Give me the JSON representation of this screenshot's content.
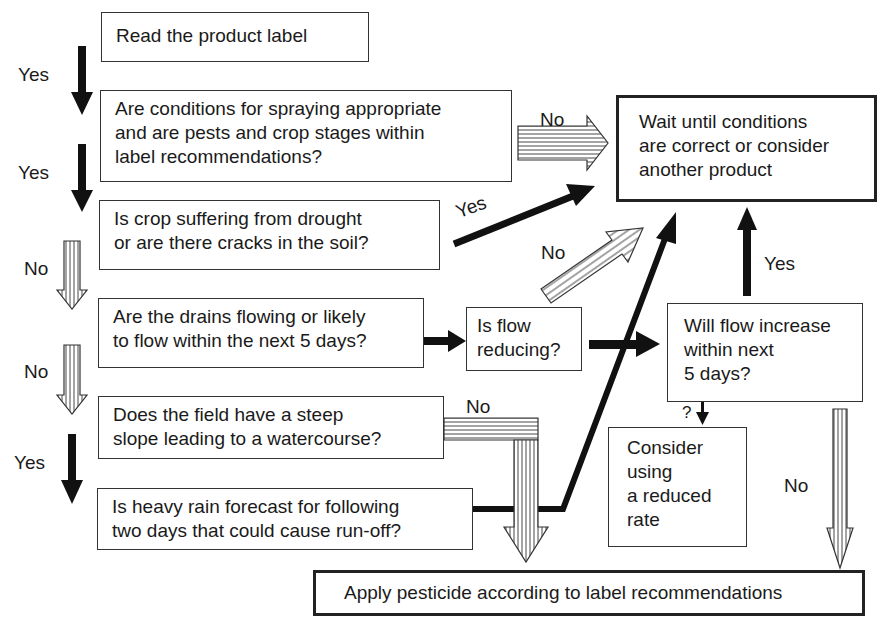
{
  "diagram": {
    "boxes": {
      "read_label": "Read the product label",
      "conditions": "Are conditions for spraying appropriate\nand are pests and crop stages within\nlabel recommendations?",
      "wait": "Wait until conditions\nare correct or consider\nanother product",
      "drought": "Is crop suffering from drought\nor are there cracks in the soil?",
      "drains": "Are the drains flowing or likely\nto flow within the next 5 days?",
      "flow_reducing": "Is flow\nreducing?",
      "flow_increase": "Will flow increase\nwithin next\n5 days?",
      "slope": "Does the field have a steep\nslope leading to a watercourse?",
      "reduced_rate": "Consider\nusing\na reduced\nrate",
      "rain": "Is heavy rain forecast for following\ntwo days that could cause run-off?",
      "apply": "Apply pesticide according to label recommendations"
    },
    "edge_labels": {
      "read_to_conditions": "Yes",
      "conditions_to_drought": "Yes",
      "conditions_to_wait": "No",
      "drought_to_wait": "Yes",
      "drought_to_drains": "No",
      "flow_reducing_to_wait": "No",
      "drains_to_slope": "No",
      "flow_increase_to_wait": "Yes",
      "flow_increase_to_reduced": "?",
      "slope_to_apply": "No",
      "slope_to_rain": "Yes",
      "flow_increase_to_apply": "No"
    },
    "colors": {
      "stroke": "#222222",
      "background": "#ffffff"
    }
  }
}
